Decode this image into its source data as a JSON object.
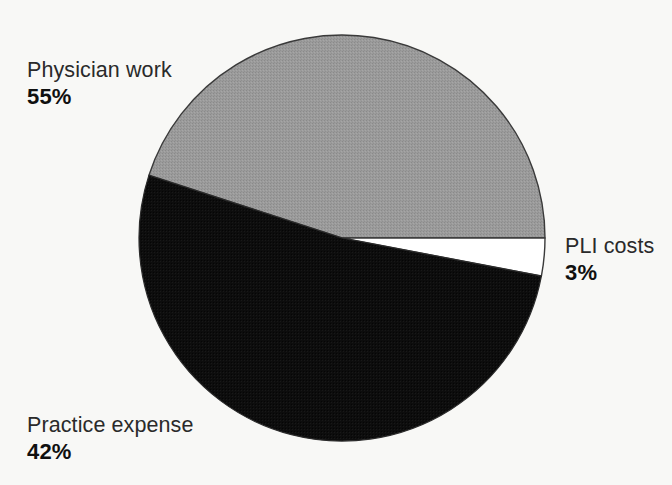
{
  "chart_data": {
    "type": "pie",
    "title": "",
    "subtitle": "",
    "categories": [
      "Physician work",
      "Practice expense",
      "PLI costs"
    ],
    "values": [
      55,
      42,
      3
    ],
    "value_suffix": "%",
    "slices": [
      {
        "label": "Physician work",
        "value": 55,
        "value_text": "55%",
        "color": "#969696",
        "start_angle_deg": 0,
        "end_angle_deg": 198,
        "label_position": "upper-left"
      },
      {
        "label": "PLI costs",
        "value": 3,
        "value_text": "3%",
        "color": "#ffffff",
        "start_angle_deg": 198,
        "end_angle_deg": 208.8,
        "label_position": "right"
      },
      {
        "label": "Practice expense",
        "value": 42,
        "value_text": "42%",
        "color": "#0d0d0d",
        "start_angle_deg": 208.8,
        "end_angle_deg": 360,
        "label_position": "lower-left"
      }
    ],
    "legend": "labels-outside",
    "grid": false,
    "xlabel": "",
    "ylabel": "",
    "total": 100,
    "units": "percent"
  },
  "geometry": {
    "center_x": 342,
    "center_y": 238,
    "radius": 203,
    "stroke_color": "#3a3a3a",
    "stroke_width": 1.4
  },
  "palette": {
    "background": "#f8f8f6",
    "gray_slice": "#969696",
    "black_slice": "#0d0d0d",
    "white_slice": "#ffffff",
    "text": "#2a2a2a",
    "value_text": "#101010"
  },
  "labels": {
    "physician_work": {
      "name": "Physician work",
      "value": "55%"
    },
    "pli_costs": {
      "name": "PLI costs",
      "value": "3%"
    },
    "practice_expense": {
      "name": "Practice expense",
      "value": "42%"
    }
  }
}
